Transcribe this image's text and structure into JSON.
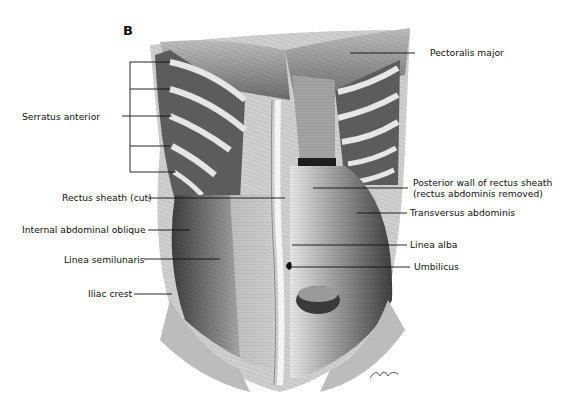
{
  "figure": {
    "panel_label": "B",
    "labels_left": [
      {
        "id": "serratus",
        "text": "Serratus anterior",
        "x": 22,
        "y": 111
      },
      {
        "id": "rectus-sheath",
        "text": "Rectus sheath (cut)",
        "x": 62,
        "y": 192
      },
      {
        "id": "internal-oblique",
        "text": "Internal abdominal oblique",
        "x": 22,
        "y": 224
      },
      {
        "id": "linea-semilunaris",
        "text": "Linea semilunaris",
        "x": 64,
        "y": 254
      },
      {
        "id": "iliac-crest",
        "text": "Iliac crest",
        "x": 88,
        "y": 288
      }
    ],
    "labels_right": [
      {
        "id": "pectoralis",
        "text": "Pectoralis major",
        "x": 430,
        "y": 47
      },
      {
        "id": "posterior-wall-1",
        "text": "Posterior wall of rectus sheath",
        "x": 413,
        "y": 177
      },
      {
        "id": "posterior-wall-2",
        "text": "(rectus abdominis removed)",
        "x": 413,
        "y": 188
      },
      {
        "id": "transversus",
        "text": "Transversus abdominis",
        "x": 410,
        "y": 207
      },
      {
        "id": "linea-alba",
        "text": "Linea alba",
        "x": 410,
        "y": 239
      },
      {
        "id": "umbilicus",
        "text": "Umbilicus",
        "x": 414,
        "y": 261
      }
    ],
    "colors": {
      "ink": "#111111",
      "muscle_dark": "#4a4a4a",
      "muscle_mid": "#8c8c8c",
      "muscle_light": "#d6d6d6",
      "background": "#ffffff"
    }
  }
}
